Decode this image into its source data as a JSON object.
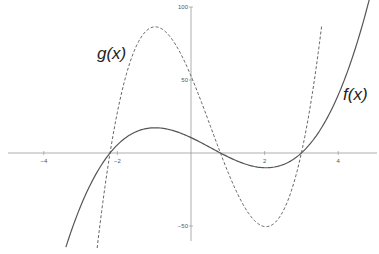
{
  "chart_data": {
    "type": "line",
    "title": "",
    "xlabel": "",
    "ylabel": "",
    "xlim": [
      -5.2,
      5.0
    ],
    "ylim": [
      -60,
      100
    ],
    "grid": false,
    "x_ticks": [
      -4,
      -2,
      2,
      4
    ],
    "y_ticks": [
      100,
      50,
      -50
    ],
    "series": [
      {
        "name": "f(x)",
        "label": "f(x)",
        "style": "solid",
        "color": "#555555",
        "formula": "2*(x+2.2)*(x-0.8)*(x-3)",
        "coef": 2,
        "roots": [
          -2.2,
          0.8,
          3.0
        ],
        "x_range": [
          -3.4,
          5.0
        ],
        "points": [
          [
            -3.4,
            -61
          ],
          [
            -2.2,
            0
          ],
          [
            -1,
            17.3
          ],
          [
            0,
            10.6
          ],
          [
            0.8,
            0
          ],
          [
            2,
            -10.1
          ],
          [
            3,
            0
          ],
          [
            4,
            30.7
          ],
          [
            5,
            97
          ]
        ]
      },
      {
        "name": "g(x)",
        "label": "g(x)",
        "style": "dashed",
        "color": "#666666",
        "formula": "10*(x+2.2)*(x-0.8)*(x-3)",
        "coef": 10,
        "roots": [
          -2.2,
          0.8,
          3.0
        ],
        "x_range": [
          -2.55,
          3.55
        ],
        "points": [
          [
            -2.55,
            -61
          ],
          [
            -2.2,
            0
          ],
          [
            -1,
            86.4
          ],
          [
            0,
            52.8
          ],
          [
            0.8,
            0
          ],
          [
            2,
            -50.4
          ],
          [
            3,
            0
          ],
          [
            3.55,
            99
          ]
        ]
      }
    ],
    "annotations": [
      {
        "text": "g(x)",
        "x": -2.0,
        "y": 75
      },
      {
        "text": "f(x)",
        "x": 4.8,
        "y": 42
      }
    ]
  }
}
